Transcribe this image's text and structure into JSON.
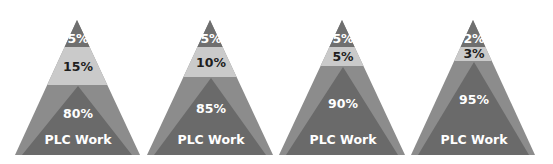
{
  "colors": {
    "top_cap": "#6f6f6f",
    "light_band": "#cacaca",
    "outer_band": "#8c8c8c",
    "inner_triangle": "#6a6a6a",
    "background": "#ffffff"
  },
  "geometry": {
    "apex_y": 20,
    "base_y": 155,
    "cap_bottom_y": 47
  },
  "pyramids": [
    {
      "apex_x": 77,
      "base_left": 15,
      "base_right": 140,
      "light_bottom_y": 85,
      "inner_apex_y": 86,
      "inner_base_left": 22,
      "inner_base_right": 132,
      "top_label": "5%",
      "mid_label": "15%",
      "main_label": "80%",
      "work_label": "PLC Work",
      "top_label_y": 43,
      "mid_label_y": 71,
      "main_label_y": 118
    },
    {
      "apex_x": 210,
      "base_left": 147,
      "base_right": 273,
      "light_bottom_y": 77,
      "inner_apex_y": 78,
      "inner_base_left": 154,
      "inner_base_right": 266,
      "top_label": "5%",
      "mid_label": "10%",
      "main_label": "85%",
      "work_label": "PLC Work",
      "top_label_y": 43,
      "mid_label_y": 67,
      "main_label_y": 113
    },
    {
      "apex_x": 342,
      "base_left": 279,
      "base_right": 405,
      "light_bottom_y": 66,
      "inner_apex_y": 67,
      "inner_base_left": 286,
      "inner_base_right": 398,
      "top_label": "5%",
      "mid_label": "5%",
      "main_label": "90%",
      "work_label": "PLC Work",
      "top_label_y": 43,
      "mid_label_y": 61,
      "main_label_y": 108
    },
    {
      "apex_x": 473,
      "base_left": 411,
      "base_right": 535,
      "light_bottom_y": 61,
      "inner_apex_y": 62,
      "inner_base_left": 418,
      "inner_base_right": 529,
      "top_label": "2%",
      "mid_label": "3%",
      "main_label": "95%",
      "work_label": "PLC Work",
      "top_label_y": 43,
      "mid_label_y": 58,
      "main_label_y": 104
    }
  ],
  "text_rows": {
    "work_label_y": 144
  }
}
